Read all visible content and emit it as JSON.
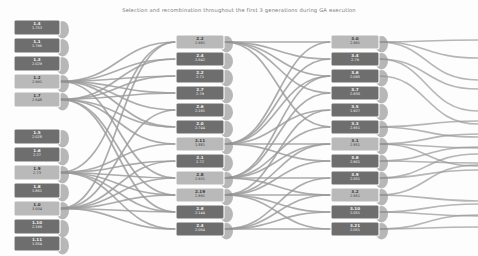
{
  "title": "Selection and recombination throughout the first 3 generations during GA execution",
  "colors": {
    "background": "#fdfdfd",
    "link": "#9a9a9a",
    "node_dark": "#6e6e6e",
    "node_light": "#b9b9b9",
    "node_stroke": "#ffffff",
    "node_shadow": "#8d8d8d",
    "label_dark": "#f2f2f2",
    "label_light": "#3a3a3a",
    "title_text": "#7a7a7a"
  },
  "chart_data": {
    "type": "diagram",
    "title": "Selection and recombination throughout the first 3 generations during GA execution",
    "subtype": "sankey-genealogy",
    "columns": [
      {
        "name": "generation-1",
        "x": 14,
        "nodes": [
          {
            "id": "1.4",
            "value": "1.753",
            "y": 20,
            "w": 46,
            "h": 15,
            "shade": "dark"
          },
          {
            "id": "1.1",
            "value": "1.796",
            "y": 38,
            "w": 46,
            "h": 15,
            "shade": "dark"
          },
          {
            "id": "1.3",
            "value": "2.029",
            "y": 56,
            "w": 46,
            "h": 15,
            "shade": "dark"
          },
          {
            "id": "1.2",
            "value": "2.991",
            "y": 74,
            "w": 46,
            "h": 15,
            "shade": "light"
          },
          {
            "id": "1.7",
            "value": "2.548",
            "y": 92,
            "w": 46,
            "h": 15,
            "shade": "light"
          },
          {
            "id": "1.5",
            "value": "2.028",
            "y": 129,
            "w": 46,
            "h": 15,
            "shade": "dark"
          },
          {
            "id": "1.6",
            "value": "2.27",
            "y": 147,
            "w": 46,
            "h": 15,
            "shade": "dark"
          },
          {
            "id": "1.9",
            "value": "2.73",
            "y": 165,
            "w": 46,
            "h": 15,
            "shade": "light"
          },
          {
            "id": "1.8",
            "value": "1.861",
            "y": 183,
            "w": 46,
            "h": 15,
            "shade": "dark"
          },
          {
            "id": "1.0",
            "value": "3.004",
            "y": 201,
            "w": 46,
            "h": 15,
            "shade": "light"
          },
          {
            "id": "1.10",
            "value": "2.199",
            "y": 219,
            "w": 46,
            "h": 15,
            "shade": "dark"
          },
          {
            "id": "1.11",
            "value": "1.554",
            "y": 236,
            "w": 46,
            "h": 15,
            "shade": "dark"
          }
        ]
      },
      {
        "name": "generation-2",
        "x": 176,
        "nodes": [
          {
            "id": "2.2",
            "value": "2.991",
            "y": 35,
            "w": 48,
            "h": 14,
            "shade": "light"
          },
          {
            "id": "2.4",
            "value": "2.642",
            "y": 52,
            "w": 48,
            "h": 14,
            "shade": "dark"
          },
          {
            "id": "2.2",
            "value": "2.71",
            "y": 69,
            "w": 48,
            "h": 14,
            "shade": "dark"
          },
          {
            "id": "2.7",
            "value": "2.79",
            "y": 86,
            "w": 48,
            "h": 14,
            "shade": "dark"
          },
          {
            "id": "2.6",
            "value": "2.191",
            "y": 103,
            "w": 48,
            "h": 14,
            "shade": "dark"
          },
          {
            "id": "2.0",
            "value": "2.744",
            "y": 120,
            "w": 48,
            "h": 14,
            "shade": "dark"
          },
          {
            "id": "2.11",
            "value": "1.881",
            "y": 137,
            "w": 48,
            "h": 14,
            "shade": "light"
          },
          {
            "id": "2.1",
            "value": "2.72",
            "y": 154,
            "w": 48,
            "h": 14,
            "shade": "dark"
          },
          {
            "id": "2.8",
            "value": "2.931",
            "y": 171,
            "w": 48,
            "h": 14,
            "shade": "light"
          },
          {
            "id": "2.19",
            "value": "2.891",
            "y": 188,
            "w": 48,
            "h": 14,
            "shade": "light"
          },
          {
            "id": "2.8",
            "value": "2.144",
            "y": 205,
            "w": 48,
            "h": 14,
            "shade": "dark"
          },
          {
            "id": "2.4",
            "value": "2.064",
            "y": 222,
            "w": 48,
            "h": 14,
            "shade": "dark"
          }
        ]
      },
      {
        "name": "generation-3",
        "x": 331,
        "nodes": [
          {
            "id": "3.0",
            "value": "2.991",
            "y": 35,
            "w": 48,
            "h": 14,
            "shade": "light"
          },
          {
            "id": "3.4",
            "value": "2.79",
            "y": 52,
            "w": 48,
            "h": 14,
            "shade": "dark"
          },
          {
            "id": "3.6",
            "value": "2.095",
            "y": 69,
            "w": 48,
            "h": 14,
            "shade": "dark"
          },
          {
            "id": "3.7",
            "value": "2.930",
            "y": 86,
            "w": 48,
            "h": 14,
            "shade": "dark"
          },
          {
            "id": "3.5",
            "value": "1.927",
            "y": 103,
            "w": 48,
            "h": 14,
            "shade": "dark"
          },
          {
            "id": "3.3",
            "value": "2.951",
            "y": 120,
            "w": 48,
            "h": 14,
            "shade": "dark"
          },
          {
            "id": "3.1",
            "value": "2.851",
            "y": 137,
            "w": 48,
            "h": 14,
            "shade": "light"
          },
          {
            "id": "3.8",
            "value": "2.901",
            "y": 154,
            "w": 48,
            "h": 14,
            "shade": "dark"
          },
          {
            "id": "3.9",
            "value": "2.051",
            "y": 171,
            "w": 48,
            "h": 14,
            "shade": "dark"
          },
          {
            "id": "3.2",
            "value": "2.951",
            "y": 188,
            "w": 48,
            "h": 14,
            "shade": "light"
          },
          {
            "id": "3.10",
            "value": "2.051",
            "y": 205,
            "w": 48,
            "h": 14,
            "shade": "dark"
          },
          {
            "id": "3.21",
            "value": "2.051",
            "y": 222,
            "w": 48,
            "h": 14,
            "shade": "dark"
          }
        ]
      }
    ],
    "links": [
      {
        "from": "c0n3",
        "to": "c1n0",
        "w": 1.7
      },
      {
        "from": "c0n3",
        "to": "c1n1",
        "w": 1.7
      },
      {
        "from": "c0n3",
        "to": "c1n2",
        "w": 1.7
      },
      {
        "from": "c0n3",
        "to": "c1n3",
        "w": 1.7
      },
      {
        "from": "c0n3",
        "to": "c1n4",
        "w": 1.7
      },
      {
        "from": "c0n3",
        "to": "c1n5",
        "w": 1.7
      },
      {
        "from": "c0n3",
        "to": "c1n8",
        "w": 1.7
      },
      {
        "from": "c0n4",
        "to": "c1n1",
        "w": 1.7
      },
      {
        "from": "c0n4",
        "to": "c1n2",
        "w": 1.7
      },
      {
        "from": "c0n4",
        "to": "c1n3",
        "w": 1.7
      },
      {
        "from": "c0n4",
        "to": "c1n5",
        "w": 1.7
      },
      {
        "from": "c0n4",
        "to": "c1n6",
        "w": 1.7
      },
      {
        "from": "c0n4",
        "to": "c1n9",
        "w": 1.7
      },
      {
        "from": "c0n4",
        "to": "c1n10",
        "w": 1.7
      },
      {
        "from": "c0n7",
        "to": "c1n0",
        "w": 1.7
      },
      {
        "from": "c0n7",
        "to": "c1n6",
        "w": 1.7
      },
      {
        "from": "c0n7",
        "to": "c1n7",
        "w": 1.7
      },
      {
        "from": "c0n7",
        "to": "c1n8",
        "w": 1.7
      },
      {
        "from": "c0n7",
        "to": "c1n9",
        "w": 1.7
      },
      {
        "from": "c0n7",
        "to": "c1n10",
        "w": 1.7
      },
      {
        "from": "c0n7",
        "to": "c1n11",
        "w": 1.7
      },
      {
        "from": "c0n9",
        "to": "c1n0",
        "w": 1.7
      },
      {
        "from": "c0n9",
        "to": "c1n4",
        "w": 1.7
      },
      {
        "from": "c0n9",
        "to": "c1n7",
        "w": 1.7
      },
      {
        "from": "c0n9",
        "to": "c1n8",
        "w": 1.7
      },
      {
        "from": "c0n9",
        "to": "c1n9",
        "w": 1.7
      },
      {
        "from": "c0n9",
        "to": "c1n10",
        "w": 1.7
      },
      {
        "from": "c0n9",
        "to": "c1n11",
        "w": 1.7
      },
      {
        "from": "c1n0",
        "to": "c2n0",
        "w": 1.7
      },
      {
        "from": "c1n0",
        "to": "c2n1",
        "w": 1.7
      },
      {
        "from": "c1n0",
        "to": "c2n2",
        "w": 1.7
      },
      {
        "from": "c1n0",
        "to": "c2n3",
        "w": 1.7
      },
      {
        "from": "c1n0",
        "to": "c2n5",
        "w": 1.7
      },
      {
        "from": "c1n6",
        "to": "c2n0",
        "w": 1.7
      },
      {
        "from": "c1n6",
        "to": "c2n1",
        "w": 1.7
      },
      {
        "from": "c1n6",
        "to": "c2n2",
        "w": 1.7
      },
      {
        "from": "c1n6",
        "to": "c2n4",
        "w": 1.7
      },
      {
        "from": "c1n6",
        "to": "c2n6",
        "w": 1.7
      },
      {
        "from": "c1n6",
        "to": "c2n7",
        "w": 1.7
      },
      {
        "from": "c1n8",
        "to": "c2n2",
        "w": 1.7
      },
      {
        "from": "c1n8",
        "to": "c2n3",
        "w": 1.7
      },
      {
        "from": "c1n8",
        "to": "c2n5",
        "w": 1.7
      },
      {
        "from": "c1n8",
        "to": "c2n6",
        "w": 1.7
      },
      {
        "from": "c1n8",
        "to": "c2n8",
        "w": 1.7
      },
      {
        "from": "c1n8",
        "to": "c2n9",
        "w": 1.7
      },
      {
        "from": "c1n9",
        "to": "c2n4",
        "w": 1.7
      },
      {
        "from": "c1n9",
        "to": "c2n6",
        "w": 1.7
      },
      {
        "from": "c1n9",
        "to": "c2n7",
        "w": 1.7
      },
      {
        "from": "c1n9",
        "to": "c2n9",
        "w": 1.7
      },
      {
        "from": "c1n9",
        "to": "c2n10",
        "w": 1.7
      },
      {
        "from": "c1n9",
        "to": "c2n11",
        "w": 1.7
      },
      {
        "from": "c1n11",
        "to": "c2n8",
        "w": 1.7
      },
      {
        "from": "c1n11",
        "to": "c2n9",
        "w": 1.7
      },
      {
        "from": "c1n11",
        "to": "c2n10",
        "w": 1.7
      },
      {
        "from": "c1n11",
        "to": "c2n11",
        "w": 1.7
      }
    ],
    "outflows": [
      {
        "from": "c2n0",
        "dy": -2
      },
      {
        "from": "c2n0",
        "dy": 16
      },
      {
        "from": "c2n0",
        "dy": 38
      },
      {
        "from": "c2n1",
        "dy": 30
      },
      {
        "from": "c2n1",
        "dy": 52
      },
      {
        "from": "c2n2",
        "dy": 48
      },
      {
        "from": "c2n5",
        "dy": -6
      },
      {
        "from": "c2n5",
        "dy": 10
      },
      {
        "from": "c2n6",
        "dy": -10
      },
      {
        "from": "c2n6",
        "dy": 4
      },
      {
        "from": "c2n6",
        "dy": 22
      },
      {
        "from": "c2n7",
        "dy": -14
      },
      {
        "from": "c2n7",
        "dy": 2
      },
      {
        "from": "c2n8",
        "dy": -24
      },
      {
        "from": "c2n8",
        "dy": -8
      },
      {
        "from": "c2n9",
        "dy": -30
      },
      {
        "from": "c2n9",
        "dy": 6
      },
      {
        "from": "c2n10",
        "dy": -8
      },
      {
        "from": "c2n10",
        "dy": 4
      },
      {
        "from": "c2n11",
        "dy": -14
      },
      {
        "from": "c2n11",
        "dy": -2
      }
    ]
  }
}
